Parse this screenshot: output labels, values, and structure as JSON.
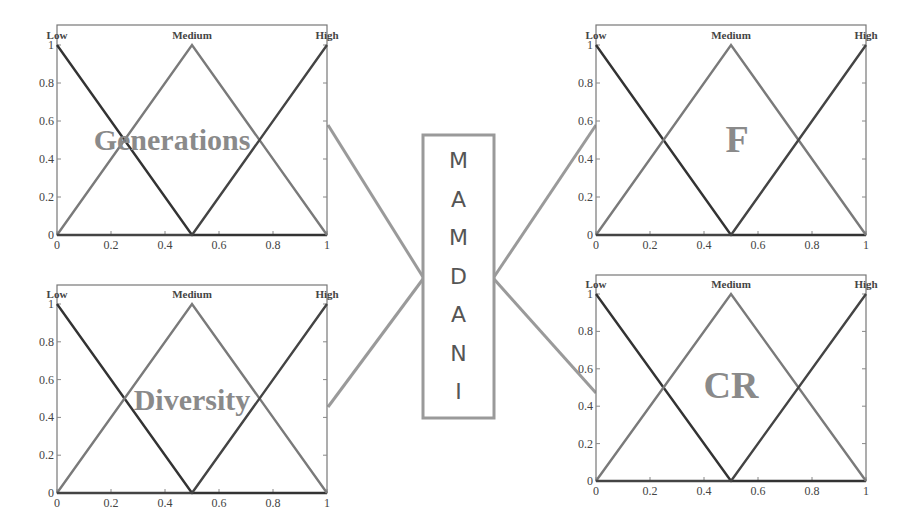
{
  "center_box": {
    "label": "MAMDANI",
    "letters": [
      "M",
      "A",
      "M",
      "D",
      "A",
      "N",
      "I"
    ]
  },
  "colors": {
    "low": "#333333",
    "medium": "#7a7a7a",
    "high": "#444444",
    "connector": "#9a9a9a",
    "frame": "#777777",
    "overlay_text": "#8a8a8a"
  },
  "chart_data": [
    {
      "type": "line",
      "title": "Generations",
      "role": "input",
      "membership_functions": [
        "Low",
        "Medium",
        "High"
      ],
      "series": [
        {
          "name": "Low",
          "x": [
            0,
            0.5,
            1
          ],
          "y": [
            1,
            0,
            0
          ]
        },
        {
          "name": "Medium",
          "x": [
            0,
            0.5,
            1
          ],
          "y": [
            0,
            1,
            0
          ]
        },
        {
          "name": "High",
          "x": [
            0,
            0.5,
            1
          ],
          "y": [
            0,
            0,
            1
          ]
        }
      ],
      "xticks": [
        "0",
        "0.2",
        "0.4",
        "0.6",
        "0.8",
        "1"
      ],
      "yticks": [
        "0",
        "0.2",
        "0.4",
        "0.6",
        "0.8",
        "1"
      ],
      "xlim": [
        0,
        1
      ],
      "ylim": [
        0,
        1
      ]
    },
    {
      "type": "line",
      "title": "Diversity",
      "role": "input",
      "membership_functions": [
        "Low",
        "Medium",
        "High"
      ],
      "series": [
        {
          "name": "Low",
          "x": [
            0,
            0.5,
            1
          ],
          "y": [
            1,
            0,
            0
          ]
        },
        {
          "name": "Medium",
          "x": [
            0,
            0.5,
            1
          ],
          "y": [
            0,
            1,
            0
          ]
        },
        {
          "name": "High",
          "x": [
            0,
            0.5,
            1
          ],
          "y": [
            0,
            0,
            1
          ]
        }
      ],
      "xticks": [
        "0",
        "0.2",
        "0.4",
        "0.6",
        "0.8",
        "1"
      ],
      "yticks": [
        "0",
        "0.2",
        "0.4",
        "0.6",
        "0.8",
        "1"
      ],
      "xlim": [
        0,
        1
      ],
      "ylim": [
        0,
        1
      ]
    },
    {
      "type": "line",
      "title": "F",
      "role": "output",
      "membership_functions": [
        "Low",
        "Medium",
        "High"
      ],
      "series": [
        {
          "name": "Low",
          "x": [
            0,
            0.5,
            1
          ],
          "y": [
            1,
            0,
            0
          ]
        },
        {
          "name": "Medium",
          "x": [
            0,
            0.5,
            1
          ],
          "y": [
            0,
            1,
            0
          ]
        },
        {
          "name": "High",
          "x": [
            0,
            0.5,
            1
          ],
          "y": [
            0,
            0,
            1
          ]
        }
      ],
      "xticks": [
        "0",
        "0.2",
        "0.4",
        "0.6",
        "0.8",
        "1"
      ],
      "yticks": [
        "0",
        "0.2",
        "0.4",
        "0.6",
        "0.8",
        "1"
      ],
      "xlim": [
        0,
        1
      ],
      "ylim": [
        0,
        1
      ]
    },
    {
      "type": "line",
      "title": "CR",
      "role": "output",
      "membership_functions": [
        "Low",
        "Medium",
        "High"
      ],
      "series": [
        {
          "name": "Low",
          "x": [
            0,
            0.5,
            1
          ],
          "y": [
            1,
            0,
            0
          ]
        },
        {
          "name": "Medium",
          "x": [
            0,
            0.5,
            1
          ],
          "y": [
            0,
            1,
            0
          ]
        },
        {
          "name": "High",
          "x": [
            0,
            0.5,
            1
          ],
          "y": [
            0,
            0,
            1
          ]
        }
      ],
      "xticks": [
        "0",
        "0.2",
        "0.4",
        "0.6",
        "0.8",
        "1"
      ],
      "yticks": [
        "0",
        "0.2",
        "0.4",
        "0.6",
        "0.8",
        "1"
      ],
      "xlim": [
        0,
        1
      ],
      "ylim": [
        0,
        1
      ]
    }
  ]
}
